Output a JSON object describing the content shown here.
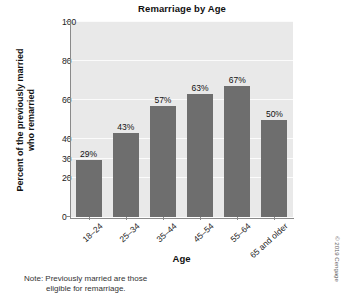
{
  "chart_data": {
    "type": "bar",
    "title": "Remarriage by Age",
    "xlabel": "Age",
    "ylabel": "Percent of the previously married who remarried",
    "categories": [
      "18–24",
      "25–34",
      "35–44",
      "45–54",
      "55–64",
      "65 and older"
    ],
    "values": [
      29,
      43,
      57,
      63,
      67,
      50
    ],
    "value_labels": [
      "29%",
      "43%",
      "57%",
      "63%",
      "67%",
      "50%"
    ],
    "ylim": [
      0,
      100
    ],
    "yticks": [
      0,
      20,
      30,
      40,
      60,
      80,
      100
    ],
    "ytick_labels": [
      "0",
      "20",
      "30",
      "40",
      "60",
      "80",
      "100"
    ],
    "grid": true,
    "legend": "none",
    "bar_color": "#6e6e6e",
    "plot_background": "#e9e9e9",
    "gridline_color": "#fbfbfb"
  },
  "ylabel_lines": {
    "line1": "Percent of the previously married",
    "line2": "who remarried"
  },
  "note": {
    "line1": "Note: Previously married are those",
    "line2": "eligible for remarriage."
  },
  "credit": {
    "text": "© 2019 Cengage"
  }
}
